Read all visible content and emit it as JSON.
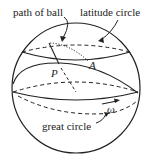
{
  "diagram": {
    "type": "sphere-geometry",
    "labels": {
      "path_of_ball": "path of ball",
      "latitude_circle": "latitude circle",
      "great_circle": "great circle",
      "point_p": "P",
      "point_a": "A",
      "omega": "ω"
    },
    "colors": {
      "stroke": "#222222",
      "background": "#ffffff"
    }
  }
}
